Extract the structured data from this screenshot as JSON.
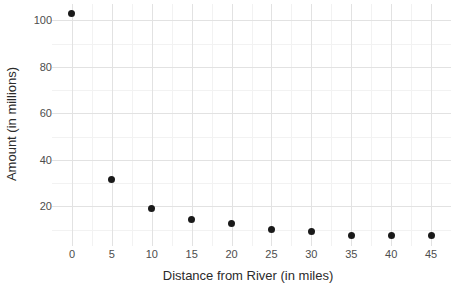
{
  "chart_data": {
    "type": "scatter",
    "title": "",
    "xlabel": "Distance from River (in miles)",
    "ylabel": "Amount (in millions)",
    "x": [
      0,
      5,
      10,
      15,
      20,
      25,
      30,
      35,
      40,
      45
    ],
    "values": [
      103,
      31.5,
      19.3,
      14.6,
      12.7,
      10.3,
      9.4,
      7.3,
      7.6,
      7.3
    ],
    "points": [
      {
        "x": 0,
        "y": 103
      },
      {
        "x": 5,
        "y": 31.5
      },
      {
        "x": 10,
        "y": 19.3
      },
      {
        "x": 15,
        "y": 14.6
      },
      {
        "x": 20,
        "y": 12.7
      },
      {
        "x": 25,
        "y": 10.3
      },
      {
        "x": 30,
        "y": 9.4
      },
      {
        "x": 35,
        "y": 7.3
      },
      {
        "x": 40,
        "y": 7.6
      },
      {
        "x": 45,
        "y": 7.3
      }
    ],
    "xlim": [
      -2.5,
      47.5
    ],
    "ylim": [
      3.0,
      107.0
    ],
    "xticks": [
      0,
      5,
      10,
      15,
      20,
      25,
      30,
      35,
      40,
      45
    ],
    "xtick_labels": [
      "0",
      "5",
      "10",
      "15",
      "20",
      "25",
      "30",
      "35",
      "40",
      "45"
    ],
    "yticks": [
      20,
      40,
      60,
      80,
      100
    ],
    "ytick_labels": [
      "20",
      "40",
      "60",
      "80",
      "100"
    ],
    "y_minor_ticks": [
      10,
      30,
      50,
      70,
      90
    ],
    "x_minor_ticks": [
      2.5,
      7.5,
      12.5,
      17.5,
      22.5,
      27.5,
      32.5,
      37.5,
      42.5
    ],
    "grid": true,
    "legend": null,
    "marker_color": "#1a1a1a",
    "grid_major_color": "#e2e2e2",
    "grid_minor_color": "#f2f2f2",
    "panel_background": "#ffffff",
    "axis_text_color": "#4d4d4d",
    "axis_title_color": "#2b2b2b"
  }
}
